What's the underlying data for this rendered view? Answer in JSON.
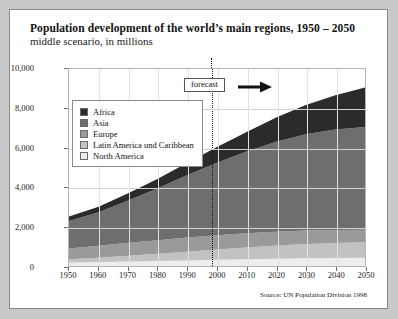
{
  "card": {
    "title": "Population development of the world’s main regions, 1950 – 2050",
    "subtitle": "middle scenario, in millions",
    "source": "Source: UN Population Division 1998"
  },
  "annotation": {
    "forecast_label": "forecast",
    "forecast_year": 1998,
    "arrow_icon": "arrow-right-icon"
  },
  "legend": {
    "position": "inside-top-left",
    "items": [
      {
        "label": "Africa",
        "color": "#2b2b2b"
      },
      {
        "label": "Asia",
        "color": "#6e6e6e"
      },
      {
        "label": "Europe",
        "color": "#9a9a9a"
      },
      {
        "label": "Latin America und Caribbean",
        "color": "#c2c2c2"
      },
      {
        "label": "North America",
        "color": "#ededed"
      }
    ]
  },
  "chart_data": {
    "type": "area",
    "title": "Population development of the world’s main regions, 1950 – 2050",
    "subtitle": "middle scenario, in millions",
    "xlabel": "",
    "ylabel": "",
    "ylim": [
      0,
      10000
    ],
    "yticks": [
      0,
      2000,
      4000,
      6000,
      8000,
      10000
    ],
    "ytick_labels": [
      "0",
      "2,000",
      "4,000",
      "6,000",
      "8,000",
      "10,000"
    ],
    "xlim": [
      1950,
      2050
    ],
    "x": [
      1950,
      1960,
      1970,
      1980,
      1990,
      2000,
      2010,
      2020,
      2030,
      2040,
      2050
    ],
    "xtick_labels": [
      "1950",
      "1960",
      "1970",
      "1980",
      "1990",
      "2000",
      "2010",
      "2020",
      "2030",
      "2040",
      "2050"
    ],
    "grid": true,
    "stacked": true,
    "stack_order_bottom_to_top": [
      "North America",
      "Latin America und Caribbean",
      "Europe",
      "Asia",
      "Africa"
    ],
    "series": [
      {
        "name": "North America",
        "color": "#ededed",
        "values": [
          172,
          204,
          232,
          254,
          282,
          314,
          346,
          372,
          392,
          408,
          420
        ]
      },
      {
        "name": "Latin America und Caribbean",
        "color": "#c2c2c2",
        "values": [
          167,
          218,
          286,
          362,
          441,
          519,
          594,
          665,
          723,
          765,
          790
        ]
      },
      {
        "name": "Europe",
        "color": "#9a9a9a",
        "values": [
          548,
          605,
          656,
          693,
          721,
          727,
          719,
          705,
          685,
          660,
          628
        ]
      },
      {
        "name": "Asia",
        "color": "#6e6e6e",
        "values": [
          1402,
          1702,
          2147,
          2642,
          3181,
          3683,
          4148,
          4570,
          4887,
          5100,
          5219
        ]
      },
      {
        "name": "Africa",
        "color": "#2b2b2b",
        "values": [
          221,
          283,
          366,
          476,
          622,
          794,
          997,
          1228,
          1480,
          1740,
          2000
        ]
      }
    ],
    "totals": [
      2510,
      3012,
      3687,
      4427,
      5247,
      6037,
      6804,
      7540,
      8167,
      8673,
      9057
    ]
  },
  "colors": {
    "page_background": "#c9c9c9",
    "card_background": "#ffffff",
    "card_border": "#8a8a8a",
    "gridline": "#d2d2d2",
    "axis_text": "#1a1a1a"
  }
}
